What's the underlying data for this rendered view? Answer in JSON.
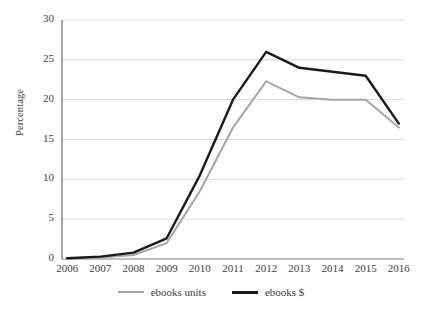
{
  "chart_data": {
    "type": "line",
    "title": "",
    "xlabel": "",
    "ylabel": "Percentage",
    "categories": [
      "2006",
      "2007",
      "2008",
      "2009",
      "2010",
      "2011",
      "2012",
      "2013",
      "2014",
      "2015",
      "2016"
    ],
    "ylim": [
      0,
      30
    ],
    "yticks": [
      0,
      5,
      10,
      15,
      20,
      25,
      30
    ],
    "grid": true,
    "legend_position": "bottom",
    "series": [
      {
        "name": "ebooks units",
        "color": "#a6a6a6",
        "values": [
          0.1,
          0.2,
          0.5,
          2.0,
          8.5,
          16.5,
          22.3,
          20.3,
          20.0,
          20.0,
          16.5
        ]
      },
      {
        "name": "ebooks $",
        "color": "#1a1a1a",
        "values": [
          0.1,
          0.3,
          0.8,
          2.6,
          10.5,
          20.0,
          26.0,
          24.0,
          23.5,
          23.0,
          17.0
        ]
      }
    ]
  },
  "axis": {
    "y_title": "Percentage",
    "y_tick_labels": [
      "30",
      "25",
      "20",
      "15",
      "10",
      "5",
      "0"
    ],
    "x_tick_labels": [
      "2006",
      "2007",
      "2008",
      "2009",
      "2010",
      "2011",
      "2012",
      "2013",
      "2014",
      "2015",
      "2016"
    ]
  },
  "legend": {
    "items": [
      {
        "label": "ebooks units",
        "swatch": "line-swatch-gray"
      },
      {
        "label": "ebooks $",
        "swatch": "line-swatch-black"
      }
    ]
  },
  "colors": {
    "series_units": "#a6a6a6",
    "series_dollars": "#1a1a1a",
    "gridline": "#d9d9d9",
    "axis": "#808080",
    "text": "#3f3f3f",
    "background": "#ffffff"
  }
}
